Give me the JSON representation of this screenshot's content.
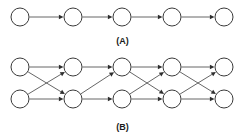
{
  "figure": {
    "width": 245,
    "height": 138,
    "background_color": "#ffffff",
    "node_fill_color": "#ffffff",
    "node_stroke_color": "#3a3a3a",
    "edge_color": "#555555",
    "arrow_color": "#2e2e2e",
    "node_radius": 9,
    "panels": [
      {
        "id": "panel-a",
        "label": "(A)",
        "label_x": 122,
        "label_y": 41,
        "description": "linear chain of five nodes connected left to right",
        "rows": 1,
        "columns": 5,
        "column_x": [
          20,
          73,
          122,
          172,
          224
        ],
        "row_y": [
          17
        ],
        "nodes": [
          {
            "id": "a1",
            "col": 0,
            "row": 0,
            "cx": 20,
            "cy": 17
          },
          {
            "id": "a2",
            "col": 1,
            "row": 0,
            "cx": 73,
            "cy": 17
          },
          {
            "id": "a3",
            "col": 2,
            "row": 0,
            "cx": 122,
            "cy": 17
          },
          {
            "id": "a4",
            "col": 3,
            "row": 0,
            "cx": 172,
            "cy": 17
          },
          {
            "id": "a5",
            "col": 4,
            "row": 0,
            "cx": 224,
            "cy": 17
          }
        ],
        "edges": [
          {
            "from": "a1",
            "to": "a2"
          },
          {
            "from": "a2",
            "to": "a3"
          },
          {
            "from": "a3",
            "to": "a4"
          },
          {
            "from": "a4",
            "to": "a5"
          }
        ]
      },
      {
        "id": "panel-b",
        "label": "(B)",
        "label_x": 122,
        "label_y": 127,
        "description": "two-row trellis of five stages with diagonal transition edges",
        "rows": 2,
        "columns": 5,
        "column_x": [
          20,
          73,
          122,
          172,
          224
        ],
        "row_y": [
          67,
          99
        ],
        "nodes": [
          {
            "id": "b1t",
            "col": 0,
            "row": 0,
            "cx": 20,
            "cy": 67
          },
          {
            "id": "b1b",
            "col": 0,
            "row": 1,
            "cx": 20,
            "cy": 99
          },
          {
            "id": "b2t",
            "col": 1,
            "row": 0,
            "cx": 73,
            "cy": 67
          },
          {
            "id": "b2b",
            "col": 1,
            "row": 1,
            "cx": 73,
            "cy": 99
          },
          {
            "id": "b3t",
            "col": 2,
            "row": 0,
            "cx": 122,
            "cy": 67
          },
          {
            "id": "b3b",
            "col": 2,
            "row": 1,
            "cx": 122,
            "cy": 99
          },
          {
            "id": "b4t",
            "col": 3,
            "row": 0,
            "cx": 172,
            "cy": 67
          },
          {
            "id": "b4b",
            "col": 3,
            "row": 1,
            "cx": 172,
            "cy": 99
          },
          {
            "id": "b5t",
            "col": 4,
            "row": 0,
            "cx": 224,
            "cy": 67
          },
          {
            "id": "b5b",
            "col": 4,
            "row": 1,
            "cx": 224,
            "cy": 99
          }
        ],
        "edges": [
          {
            "from": "b1t",
            "to": "b2t"
          },
          {
            "from": "b1t",
            "to": "b2b"
          },
          {
            "from": "b1b",
            "to": "b2t"
          },
          {
            "from": "b1b",
            "to": "b2b"
          },
          {
            "from": "b2t",
            "to": "b3t"
          },
          {
            "from": "b2b",
            "to": "b3t"
          },
          {
            "from": "b2b",
            "to": "b3b"
          },
          {
            "from": "b3t",
            "to": "b4t"
          },
          {
            "from": "b3t",
            "to": "b4b"
          },
          {
            "from": "b3b",
            "to": "b4t"
          },
          {
            "from": "b3b",
            "to": "b4b"
          },
          {
            "from": "b4t",
            "to": "b5t"
          },
          {
            "from": "b4t",
            "to": "b5b"
          },
          {
            "from": "b4b",
            "to": "b5t"
          },
          {
            "from": "b4b",
            "to": "b5b"
          }
        ]
      }
    ]
  }
}
